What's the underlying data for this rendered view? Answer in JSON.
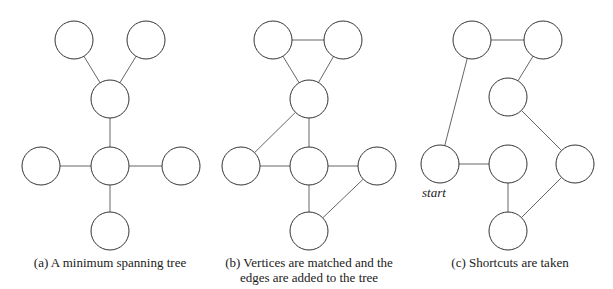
{
  "panels": [
    {
      "id": "a",
      "caption": "(a) A minimum spanning tree",
      "nodes": [
        {
          "id": "tl",
          "x": 74,
          "y": 40
        },
        {
          "id": "tr",
          "x": 146,
          "y": 40
        },
        {
          "id": "m",
          "x": 110,
          "y": 99
        },
        {
          "id": "c",
          "x": 110,
          "y": 166
        },
        {
          "id": "l",
          "x": 41,
          "y": 166
        },
        {
          "id": "r",
          "x": 181,
          "y": 166
        },
        {
          "id": "b",
          "x": 110,
          "y": 231
        }
      ],
      "edges": [
        [
          "tl",
          "m"
        ],
        [
          "tr",
          "m"
        ],
        [
          "m",
          "c"
        ],
        [
          "l",
          "c"
        ],
        [
          "c",
          "r"
        ],
        [
          "c",
          "b"
        ]
      ]
    },
    {
      "id": "b",
      "caption_line1": "(b) Vertices are matched and the",
      "caption_line2": "edges are added to the tree",
      "nodes": [
        {
          "id": "tl",
          "x": 273,
          "y": 40
        },
        {
          "id": "tr",
          "x": 343,
          "y": 40
        },
        {
          "id": "m",
          "x": 309,
          "y": 99
        },
        {
          "id": "l",
          "x": 241,
          "y": 166
        },
        {
          "id": "c",
          "x": 309,
          "y": 166
        },
        {
          "id": "r",
          "x": 377,
          "y": 166
        },
        {
          "id": "b",
          "x": 309,
          "y": 231
        }
      ],
      "edges": [
        [
          "tl",
          "tr"
        ],
        [
          "tl",
          "m"
        ],
        [
          "tr",
          "m"
        ],
        [
          "m",
          "c"
        ],
        [
          "m",
          "l"
        ],
        [
          "l",
          "c"
        ],
        [
          "c",
          "r"
        ],
        [
          "c",
          "b"
        ],
        [
          "r",
          "b"
        ]
      ]
    },
    {
      "id": "c",
      "caption": "(c) Shortcuts are taken",
      "start_label": "start",
      "nodes": [
        {
          "id": "tl",
          "x": 472,
          "y": 40
        },
        {
          "id": "tr",
          "x": 543,
          "y": 40
        },
        {
          "id": "m",
          "x": 508,
          "y": 97
        },
        {
          "id": "l",
          "x": 440,
          "y": 164
        },
        {
          "id": "c",
          "x": 508,
          "y": 164
        },
        {
          "id": "r",
          "x": 575,
          "y": 164
        },
        {
          "id": "b",
          "x": 508,
          "y": 231
        }
      ],
      "edges": [
        [
          "l",
          "tl"
        ],
        [
          "tl",
          "tr"
        ],
        [
          "tr",
          "m"
        ],
        [
          "m",
          "r"
        ],
        [
          "r",
          "b"
        ],
        [
          "b",
          "c"
        ],
        [
          "c",
          "l"
        ]
      ]
    }
  ],
  "style": {
    "node_radius": 19,
    "stroke": "#333333",
    "edge_stroke": "#555555"
  }
}
